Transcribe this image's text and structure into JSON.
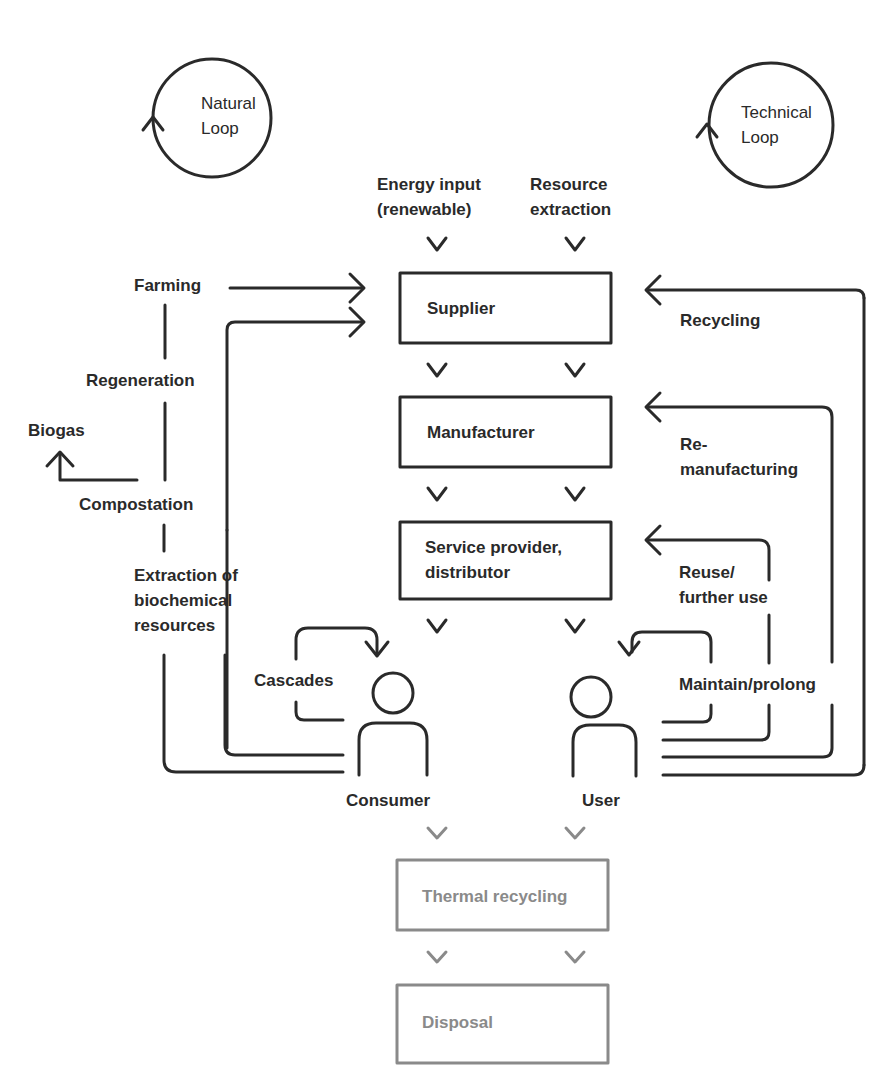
{
  "loops": {
    "natural": {
      "line1": "Natural",
      "line2": "Loop"
    },
    "technical": {
      "line1": "Technical",
      "line2": "Loop"
    }
  },
  "inputs": {
    "energy": {
      "line1": "Energy input",
      "line2": "(renewable)"
    },
    "resource": {
      "line1": "Resource",
      "line2": "extraction"
    }
  },
  "boxes": {
    "supplier": "Supplier",
    "manufacturer": "Manufacturer",
    "service": {
      "line1": "Service provider,",
      "line2": "distributor"
    },
    "thermal": "Thermal recycling",
    "disposal": "Disposal"
  },
  "natural_side": {
    "farming": "Farming",
    "regeneration": "Regeneration",
    "biogas": "Biogas",
    "compostation": "Compostation",
    "extraction": {
      "line1": "Extraction of",
      "line2": "biochemical",
      "line3": "resources"
    },
    "cascades": "Cascades"
  },
  "technical_side": {
    "recycling": "Recycling",
    "remanufacturing": {
      "line1": "Re-",
      "line2": "manufacturing"
    },
    "reuse": {
      "line1": "Reuse/",
      "line2": "further use"
    },
    "maintain": "Maintain/prolong"
  },
  "actors": {
    "consumer": "Consumer",
    "user": "User"
  },
  "colors": {
    "line": "#2a2a2a",
    "faded": "#8a8a8a"
  }
}
